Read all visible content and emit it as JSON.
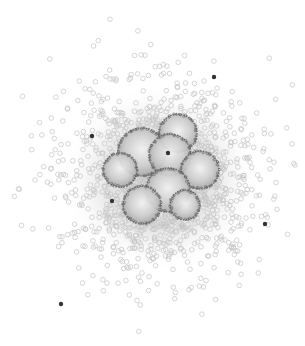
{
  "diagram": {
    "type": "network-cluster-scatter",
    "width": 305,
    "height": 346,
    "background": "#ffffff",
    "colors": {
      "peripheral_node_stroke": "#c4c4c4",
      "dense_fill": "#d6d6d6",
      "cluster_stroke": "#6e6e6e",
      "cluster_fill_center": "#f4f4f4",
      "cluster_fill_edge": "#a8a8a8",
      "highlight_node": "#333333"
    },
    "cloud": {
      "center": [
        160,
        178
      ],
      "radius_x": 135,
      "radius_y": 130,
      "node_radius": 2.3,
      "node_count": 1400
    },
    "clusters": [
      {
        "id": "c1",
        "cx": 142,
        "cy": 152,
        "r": 24
      },
      {
        "id": "c2",
        "cx": 178,
        "cy": 133,
        "r": 19
      },
      {
        "id": "c3",
        "cx": 170,
        "cy": 155,
        "r": 21
      },
      {
        "id": "c4",
        "cx": 200,
        "cy": 170,
        "r": 19
      },
      {
        "id": "c5",
        "cx": 168,
        "cy": 190,
        "r": 22
      },
      {
        "id": "c6",
        "cx": 142,
        "cy": 205,
        "r": 19
      },
      {
        "id": "c7",
        "cx": 120,
        "cy": 170,
        "r": 17
      },
      {
        "id": "c8",
        "cx": 185,
        "cy": 205,
        "r": 15
      }
    ],
    "highlight_nodes": [
      {
        "x": 214,
        "y": 77,
        "r": 2.2
      },
      {
        "x": 92,
        "y": 136,
        "r": 2.2
      },
      {
        "x": 168,
        "y": 153,
        "r": 2.2
      },
      {
        "x": 112,
        "y": 201,
        "r": 2.2
      },
      {
        "x": 265,
        "y": 224,
        "r": 2.2
      },
      {
        "x": 61,
        "y": 304,
        "r": 2.2
      }
    ]
  }
}
